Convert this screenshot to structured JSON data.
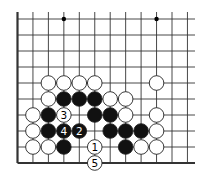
{
  "diagram": {
    "type": "go-board-fragment",
    "columns": 12,
    "rows": 10,
    "edges": [
      "left",
      "bottom"
    ],
    "hoshi": [
      [
        3,
        0
      ],
      [
        9,
        0
      ]
    ],
    "colors": {
      "black": "#111111",
      "white": "#ffffff",
      "line": "#333333",
      "background": "#ffffff"
    },
    "stones": [
      {
        "c": 2,
        "r": 4,
        "color": "white"
      },
      {
        "c": 3,
        "r": 4,
        "color": "white"
      },
      {
        "c": 4,
        "r": 4,
        "color": "white"
      },
      {
        "c": 5,
        "r": 4,
        "color": "white"
      },
      {
        "c": 9,
        "r": 4,
        "color": "white"
      },
      {
        "c": 2,
        "r": 5,
        "color": "white"
      },
      {
        "c": 3,
        "r": 5,
        "color": "black"
      },
      {
        "c": 4,
        "r": 5,
        "color": "black"
      },
      {
        "c": 5,
        "r": 5,
        "color": "black"
      },
      {
        "c": 6,
        "r": 5,
        "color": "white"
      },
      {
        "c": 7,
        "r": 5,
        "color": "white"
      },
      {
        "c": 1,
        "r": 6,
        "color": "white"
      },
      {
        "c": 2,
        "r": 6,
        "color": "black"
      },
      {
        "c": 3,
        "r": 6,
        "color": "white",
        "label": "3"
      },
      {
        "c": 5,
        "r": 6,
        "color": "black"
      },
      {
        "c": 6,
        "r": 6,
        "color": "black"
      },
      {
        "c": 7,
        "r": 6,
        "color": "white"
      },
      {
        "c": 9,
        "r": 6,
        "color": "white"
      },
      {
        "c": 1,
        "r": 7,
        "color": "white"
      },
      {
        "c": 2,
        "r": 7,
        "color": "black"
      },
      {
        "c": 3,
        "r": 7,
        "color": "black",
        "label": "4"
      },
      {
        "c": 4,
        "r": 7,
        "color": "black",
        "label": "2"
      },
      {
        "c": 6,
        "r": 7,
        "color": "black"
      },
      {
        "c": 7,
        "r": 7,
        "color": "black"
      },
      {
        "c": 8,
        "r": 7,
        "color": "black"
      },
      {
        "c": 9,
        "r": 7,
        "color": "white"
      },
      {
        "c": 1,
        "r": 8,
        "color": "white"
      },
      {
        "c": 2,
        "r": 8,
        "color": "white"
      },
      {
        "c": 3,
        "r": 8,
        "color": "black"
      },
      {
        "c": 5,
        "r": 8,
        "color": "white",
        "label": "1"
      },
      {
        "c": 7,
        "r": 8,
        "color": "black"
      },
      {
        "c": 8,
        "r": 8,
        "color": "white"
      },
      {
        "c": 9,
        "r": 8,
        "color": "white"
      },
      {
        "c": 5,
        "r": 9,
        "color": "white",
        "label": "5"
      }
    ]
  }
}
